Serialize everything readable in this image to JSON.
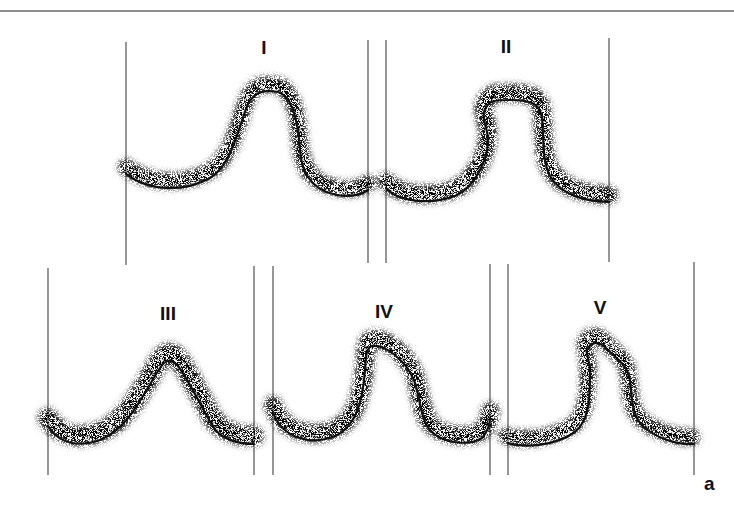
{
  "figure": {
    "figure_label": "a",
    "panels": [
      {
        "id": "I",
        "label": "I"
      },
      {
        "id": "II",
        "label": "II"
      },
      {
        "id": "III",
        "label": "III"
      },
      {
        "id": "IV",
        "label": "IV"
      },
      {
        "id": "V",
        "label": "V"
      }
    ]
  }
}
